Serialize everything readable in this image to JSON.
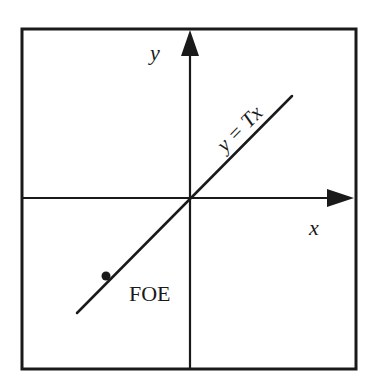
{
  "diagram": {
    "labels": {
      "y_axis": "y",
      "x_axis": "x",
      "line_equation": "y = Tx",
      "point": "FOE"
    },
    "colors": {
      "stroke": "#1a1a1a",
      "background": "#ffffff"
    },
    "geometry": {
      "frame": {
        "left": 22,
        "top": 28,
        "right": 356,
        "bottom": 369
      },
      "origin": {
        "x": 190,
        "y": 198
      },
      "line_start": {
        "x": 77,
        "y": 313
      },
      "line_end": {
        "x": 292,
        "y": 96
      },
      "foe_point": {
        "x": 106,
        "y": 275
      }
    }
  }
}
